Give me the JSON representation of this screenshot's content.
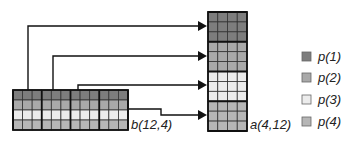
{
  "matrix_b": {
    "label": "b(12,4)",
    "cols": 12,
    "rows": 4,
    "block_cols": 3
  },
  "matrix_a": {
    "label": "a(4,12)",
    "cols": 4,
    "rows": 12,
    "block_rows": 3
  },
  "colors": {
    "p1": "#7d7d7d",
    "p2": "#a9a9a9",
    "p3": "#ececec",
    "p4": "#b6b6b6",
    "line": "#111111"
  },
  "legend": [
    {
      "label": "p(1)",
      "color": "#7d7d7d"
    },
    {
      "label": "p(2)",
      "color": "#a9a9a9"
    },
    {
      "label": "p(3)",
      "color": "#ececec"
    },
    {
      "label": "p(4)",
      "color": "#b6b6b6"
    }
  ]
}
